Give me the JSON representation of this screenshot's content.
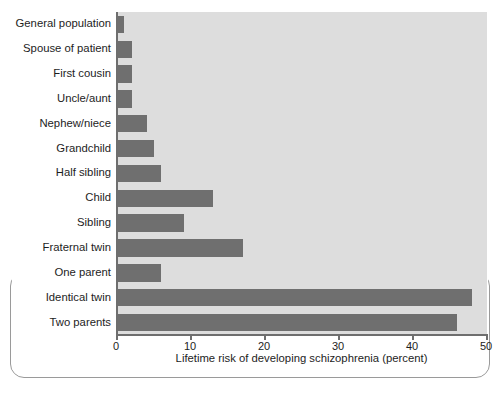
{
  "figure": {
    "plot_background_color": "#dddddd",
    "bar_color": "#6f6f6f",
    "axis_color": "#6e6e6e"
  },
  "chart_data": {
    "type": "bar",
    "orientation": "horizontal",
    "title": "",
    "xlabel": "Lifetime risk of developing schizophrenia (percent)",
    "ylabel": "",
    "xlim": [
      0,
      50
    ],
    "xticks": [
      0,
      10,
      20,
      30,
      40,
      50
    ],
    "xtick_labels": [
      "0",
      "10",
      "20",
      "30",
      "40",
      "50"
    ],
    "grid": false,
    "legend": "none",
    "categories": [
      "General population",
      "Spouse of patient",
      "First cousin",
      "Uncle/aunt",
      "Nephew/niece",
      "Grandchild",
      "Half sibling",
      "Child",
      "Sibling",
      "Fraternal twin",
      "One parent",
      "Identical twin",
      "Two parents"
    ],
    "values": [
      1,
      2,
      2,
      2,
      4,
      5,
      6,
      13,
      9,
      17,
      6,
      48,
      46
    ]
  }
}
